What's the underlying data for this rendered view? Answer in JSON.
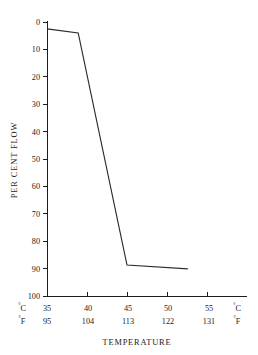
{
  "chart_data": {
    "type": "line",
    "title": "",
    "xlabel": "TEMPERATURE",
    "ylabel": "PER CENT  FLOW",
    "x_units_left_top": "°C",
    "x_units_left_bottom": "°F",
    "x_units_right_top": "°C",
    "x_units_right_bottom": "°F",
    "x_celsius_ticks": [
      "35",
      "40",
      "45",
      "50",
      "55"
    ],
    "x_fahrenheit_ticks": [
      "95",
      "104",
      "113",
      "122",
      "131"
    ],
    "x_celsius_values": [
      35,
      40,
      45,
      50,
      55
    ],
    "x_fahrenheit_values": [
      95,
      104,
      113,
      122,
      131
    ],
    "xlim_celsius": [
      35,
      60
    ],
    "y_ticks": [
      "0",
      "10",
      "20",
      "30",
      "40",
      "50",
      "60",
      "70",
      "80",
      "90",
      "100"
    ],
    "y_values": [
      0,
      10,
      20,
      30,
      40,
      50,
      60,
      70,
      80,
      90,
      100
    ],
    "ylim": [
      0,
      100
    ],
    "y_inverted": true,
    "grid": false,
    "legend": null,
    "series": [
      {
        "name": "per cent flow",
        "x": [
          35.0,
          38.9,
          45.0,
          52.6
        ],
        "y": [
          2.5,
          4.0,
          88.7,
          90.1
        ]
      }
    ],
    "line_color": "#2a2a2a",
    "background_color": "#ffffff",
    "axis_color": "#1d1d1d"
  },
  "geometry": {
    "x_axis_y_px": 296,
    "y_axis_x_px": 47,
    "y_top_px": 22,
    "x_right_px": 247,
    "px_per_5C": 40
  }
}
